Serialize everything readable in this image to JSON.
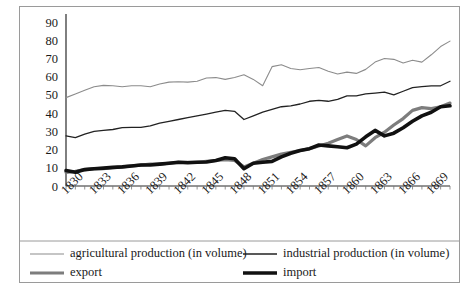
{
  "chart_data": {
    "type": "line",
    "title": "",
    "xlabel": "",
    "ylabel": "",
    "xlim": [
      1830,
      1871
    ],
    "ylim": [
      0,
      90
    ],
    "ytick_step": 10,
    "yticks": [
      0,
      10,
      20,
      30,
      40,
      50,
      60,
      70,
      80,
      90
    ],
    "xticks": [
      1830,
      1833,
      1836,
      1839,
      1842,
      1845,
      1848,
      1851,
      1854,
      1857,
      1860,
      1863,
      1866,
      1869
    ],
    "xtick_labels": [
      "1830",
      "1833",
      "1836",
      "1839",
      "1842",
      "1845",
      "1848",
      "1851",
      "1854",
      "1857",
      "1860",
      "1863",
      "1866",
      "1869"
    ],
    "grid": false,
    "legend_position": "bottom",
    "x": [
      1830,
      1831,
      1832,
      1833,
      1834,
      1835,
      1836,
      1837,
      1838,
      1839,
      1840,
      1841,
      1842,
      1843,
      1844,
      1845,
      1846,
      1847,
      1848,
      1849,
      1850,
      1851,
      1852,
      1853,
      1854,
      1855,
      1856,
      1857,
      1858,
      1859,
      1860,
      1861,
      1862,
      1863,
      1864,
      1865,
      1866,
      1867,
      1868,
      1869,
      1870,
      1871
    ],
    "series": [
      {
        "name": "agricultural production (in volume)",
        "color": "#8c8c8c",
        "width": 1.1,
        "values": [
          48.5,
          50.5,
          52.5,
          54.5,
          55.2,
          55.0,
          54.5,
          55.0,
          55.0,
          54.5,
          56.0,
          57.0,
          57.2,
          57.0,
          57.5,
          59.3,
          59.5,
          58.5,
          59.5,
          61.0,
          58.5,
          55.0,
          65.5,
          66.5,
          64.5,
          63.8,
          64.5,
          65.0,
          63.0,
          61.5,
          62.5,
          61.8,
          64.0,
          68.0,
          70.0,
          69.5,
          67.5,
          69.0,
          68.0,
          72.0,
          76.5,
          79.5
        ]
      },
      {
        "name": "industrial production (in volume)",
        "color": "#222222",
        "width": 1.3,
        "values": [
          27.5,
          26.5,
          28.5,
          30.0,
          30.5,
          31.0,
          32.0,
          32.2,
          32.2,
          33.0,
          34.5,
          35.5,
          36.5,
          37.5,
          38.5,
          39.5,
          40.5,
          41.5,
          41.0,
          36.5,
          38.5,
          40.5,
          42.0,
          43.5,
          44.0,
          45.0,
          46.5,
          47.0,
          46.5,
          47.5,
          49.5,
          49.5,
          50.5,
          51.0,
          51.5,
          50.0,
          52.0,
          54.0,
          54.5,
          55.0,
          55.0,
          57.5
        ]
      },
      {
        "name": "export",
        "color": "#7d7d7d",
        "width": 3.2,
        "values": [
          7.5,
          8.0,
          9.0,
          9.5,
          9.5,
          10.0,
          10.5,
          11.0,
          11.5,
          12.0,
          12.0,
          12.5,
          13.0,
          13.0,
          13.0,
          13.5,
          14.0,
          14.5,
          14.0,
          10.5,
          12.5,
          14.5,
          16.0,
          17.5,
          18.5,
          19.5,
          20.5,
          22.0,
          23.5,
          25.5,
          27.5,
          25.5,
          22.0,
          26.5,
          29.5,
          33.5,
          37.0,
          41.5,
          43.0,
          42.5,
          43.5,
          45.5
        ]
      },
      {
        "name": "import",
        "color": "#111111",
        "width": 3.6,
        "values": [
          8.5,
          7.5,
          9.0,
          9.5,
          9.8,
          10.2,
          10.5,
          11.0,
          11.5,
          11.5,
          12.0,
          12.5,
          13.0,
          12.8,
          13.0,
          13.2,
          14.0,
          15.5,
          15.0,
          9.5,
          12.5,
          13.0,
          13.5,
          16.0,
          18.0,
          19.5,
          20.5,
          22.5,
          22.0,
          21.5,
          21.0,
          23.0,
          27.0,
          30.5,
          27.5,
          29.0,
          32.0,
          35.5,
          38.5,
          40.5,
          43.5,
          44.0
        ]
      }
    ],
    "legend": [
      {
        "label": "agricultural production (in volume)",
        "color": "#8c8c8c",
        "width": 1.1
      },
      {
        "label": "industrial production (in volume)",
        "color": "#222222",
        "width": 1.3
      },
      {
        "label": "export",
        "color": "#7d7d7d",
        "width": 3.2
      },
      {
        "label": "import",
        "color": "#111111",
        "width": 3.6
      }
    ]
  }
}
